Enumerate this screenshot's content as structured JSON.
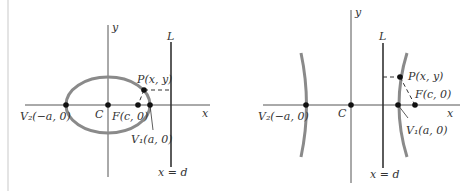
{
  "figures": [
    {
      "name": "ellipse",
      "axis_x_label": "x",
      "axis_y_label": "y",
      "directrix_label": "L",
      "directrix_equation": "x = d",
      "points": {
        "V2": "V₂(−a, 0)",
        "C": "C",
        "F": "F(c, 0)",
        "V1": "V₁(a, 0)",
        "P": "P(x, y)"
      }
    },
    {
      "name": "hyperbola",
      "axis_x_label": "x",
      "axis_y_label": "y",
      "directrix_label": "L",
      "directrix_equation": "x = d",
      "points": {
        "V2": "V₂(−a, 0)",
        "C": "C",
        "F": "F(c, 0)",
        "V1": "V₁(a, 0)",
        "P": "P(x, y)"
      }
    }
  ],
  "colors": {
    "curve": "#8a8a8a",
    "axis": "#555555",
    "point": "#111111"
  }
}
